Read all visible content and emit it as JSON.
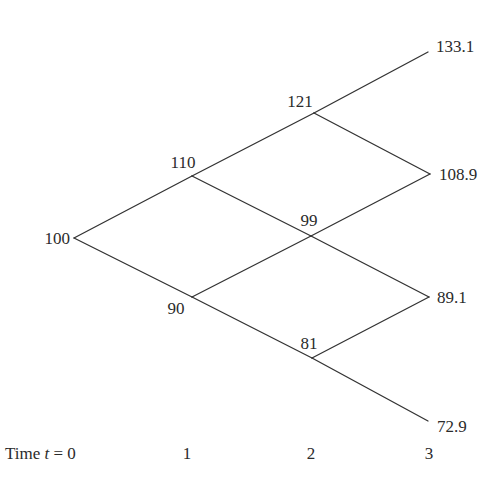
{
  "diagram": {
    "type": "binomial-tree",
    "steps": 3,
    "nodes": [
      {
        "id": "n0_0",
        "time": 0,
        "label": "100"
      },
      {
        "id": "n1_u",
        "time": 1,
        "label": "110"
      },
      {
        "id": "n1_d",
        "time": 1,
        "label": "90"
      },
      {
        "id": "n2_uu",
        "time": 2,
        "label": "121"
      },
      {
        "id": "n2_ud",
        "time": 2,
        "label": "99"
      },
      {
        "id": "n2_dd",
        "time": 2,
        "label": "81"
      },
      {
        "id": "n3_uuu",
        "time": 3,
        "label": "133.1"
      },
      {
        "id": "n3_uud",
        "time": 3,
        "label": "108.9"
      },
      {
        "id": "n3_udd",
        "time": 3,
        "label": "89.1"
      },
      {
        "id": "n3_ddd",
        "time": 3,
        "label": "72.9"
      }
    ],
    "edges": [
      [
        "n0_0",
        "n1_u"
      ],
      [
        "n0_0",
        "n1_d"
      ],
      [
        "n1_u",
        "n2_uu"
      ],
      [
        "n1_u",
        "n2_ud"
      ],
      [
        "n1_d",
        "n2_ud"
      ],
      [
        "n1_d",
        "n2_dd"
      ],
      [
        "n2_uu",
        "n3_uuu"
      ],
      [
        "n2_uu",
        "n3_uud"
      ],
      [
        "n2_ud",
        "n3_uud"
      ],
      [
        "n2_ud",
        "n3_udd"
      ],
      [
        "n2_dd",
        "n3_udd"
      ],
      [
        "n2_dd",
        "n3_ddd"
      ]
    ]
  },
  "labels": {
    "n0_0": "100",
    "n1_u": "110",
    "n1_d": "90",
    "n2_uu": "121",
    "n2_ud": "99",
    "n2_dd": "81",
    "n3_uuu": "133.1",
    "n3_uud": "108.9",
    "n3_udd": "89.1",
    "n3_ddd": "72.9"
  },
  "time_axis": {
    "prefix": "Time ",
    "variable": "t",
    "equals": " = 0",
    "t1": "1",
    "t2": "2",
    "t3": "3"
  }
}
